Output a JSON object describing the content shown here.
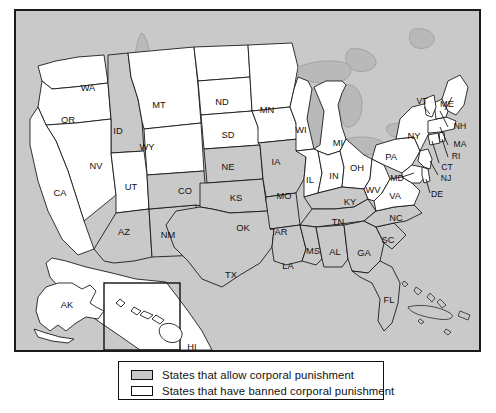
{
  "map": {
    "title": "US states corporal punishment map",
    "ocean_color": "#c9c9c9",
    "allow_color": "#c9c9c9",
    "banned_color": "#ffffff",
    "border_color": "#111111",
    "insets": [
      "AK",
      "HI"
    ],
    "states": [
      {
        "code": "WA",
        "status": "banned",
        "x": 72,
        "y": 78
      },
      {
        "code": "OR",
        "status": "banned",
        "x": 52,
        "y": 110
      },
      {
        "code": "ID",
        "status": "allow",
        "x": 102,
        "y": 121
      },
      {
        "code": "MT",
        "status": "banned",
        "x": 143,
        "y": 95
      },
      {
        "code": "WY",
        "status": "banned",
        "x": 131,
        "y": 137
      },
      {
        "code": "ND",
        "status": "banned",
        "x": 206,
        "y": 92
      },
      {
        "code": "SD",
        "status": "banned",
        "x": 212,
        "y": 125
      },
      {
        "code": "MN",
        "status": "banned",
        "x": 251,
        "y": 100
      },
      {
        "code": "NV",
        "status": "banned",
        "x": 80,
        "y": 156
      },
      {
        "code": "UT",
        "status": "banned",
        "x": 115,
        "y": 177
      },
      {
        "code": "CA",
        "status": "banned",
        "x": 44,
        "y": 183
      },
      {
        "code": "AZ",
        "status": "allow",
        "x": 108,
        "y": 222
      },
      {
        "code": "NM",
        "status": "allow",
        "x": 152,
        "y": 225
      },
      {
        "code": "CO",
        "status": "allow",
        "x": 169,
        "y": 181
      },
      {
        "code": "NE",
        "status": "banned",
        "x": 212,
        "y": 157
      },
      {
        "code": "IA",
        "status": "banned",
        "x": 260,
        "y": 152
      },
      {
        "code": "WI",
        "status": "banned",
        "x": 285,
        "y": 120
      },
      {
        "code": "KS",
        "status": "allow",
        "x": 220,
        "y": 188
      },
      {
        "code": "MO",
        "status": "allow",
        "x": 268,
        "y": 186
      },
      {
        "code": "IL",
        "status": "banned",
        "x": 294,
        "y": 170
      },
      {
        "code": "IN",
        "status": "banned",
        "x": 318,
        "y": 166
      },
      {
        "code": "OH",
        "status": "banned",
        "x": 341,
        "y": 158
      },
      {
        "code": "MI",
        "status": "banned",
        "x": 322,
        "y": 133
      },
      {
        "code": "OK",
        "status": "allow",
        "x": 227,
        "y": 218
      },
      {
        "code": "AR",
        "status": "allow",
        "x": 265,
        "y": 222
      },
      {
        "code": "TX",
        "status": "allow",
        "x": 215,
        "y": 265
      },
      {
        "code": "LA",
        "status": "allow",
        "x": 272,
        "y": 256
      },
      {
        "code": "MS",
        "status": "allow",
        "x": 297,
        "y": 241
      },
      {
        "code": "AL",
        "status": "allow",
        "x": 319,
        "y": 242
      },
      {
        "code": "TN",
        "status": "allow",
        "x": 322,
        "y": 212
      },
      {
        "code": "KY",
        "status": "allow",
        "x": 334,
        "y": 192
      },
      {
        "code": "GA",
        "status": "allow",
        "x": 348,
        "y": 243
      },
      {
        "code": "SC",
        "status": "allow",
        "x": 372,
        "y": 230
      },
      {
        "code": "NC",
        "status": "allow",
        "x": 380,
        "y": 208
      },
      {
        "code": "FL",
        "status": "allow",
        "x": 373,
        "y": 290
      },
      {
        "code": "VA",
        "status": "banned",
        "x": 379,
        "y": 186
      },
      {
        "code": "WV",
        "status": "banned",
        "x": 357,
        "y": 180
      },
      {
        "code": "PA",
        "status": "banned",
        "x": 375,
        "y": 147
      },
      {
        "code": "NY",
        "status": "banned",
        "x": 398,
        "y": 126
      },
      {
        "code": "MD",
        "status": "banned",
        "x": 381,
        "y": 168
      },
      {
        "code": "DE",
        "status": "banned",
        "x": 421,
        "y": 184
      },
      {
        "code": "NJ",
        "status": "banned",
        "x": 430,
        "y": 168
      },
      {
        "code": "CT",
        "status": "banned",
        "x": 431,
        "y": 157
      },
      {
        "code": "RI",
        "status": "banned",
        "x": 440,
        "y": 146
      },
      {
        "code": "MA",
        "status": "banned",
        "x": 444,
        "y": 134
      },
      {
        "code": "NH",
        "status": "banned",
        "x": 444,
        "y": 116
      },
      {
        "code": "VT",
        "status": "banned",
        "x": 406,
        "y": 91
      },
      {
        "code": "ME",
        "status": "banned",
        "x": 431,
        "y": 94
      },
      {
        "code": "AK",
        "status": "banned",
        "x": 51,
        "y": 295
      },
      {
        "code": "HI",
        "status": "banned",
        "x": 176,
        "y": 337
      }
    ]
  },
  "legend": {
    "items": [
      {
        "swatch": "allow",
        "label": "States that allow corporal punishment"
      },
      {
        "swatch": "banned",
        "label": "States that have banned corporal punishment"
      }
    ]
  }
}
